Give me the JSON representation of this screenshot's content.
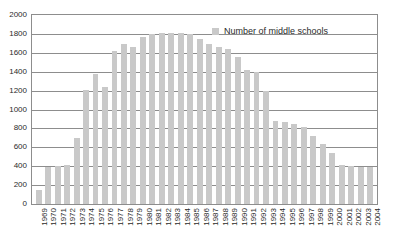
{
  "chart_data": {
    "type": "bar",
    "title": "",
    "xlabel": "",
    "ylabel": "",
    "ylim": [
      0,
      2000
    ],
    "ytick_step": 200,
    "yticks": [
      2000,
      1800,
      1600,
      1400,
      1200,
      1000,
      800,
      600,
      400,
      200,
      0
    ],
    "grid": true,
    "legend_position": "top-right",
    "legend": [
      "Number of middle schools"
    ],
    "bar_color": "#c9c9c9",
    "axis_color": "#8d8d8d",
    "categories": [
      "1969",
      "1970",
      "1971",
      "1972",
      "1973",
      "1974",
      "1975",
      "1976",
      "1977",
      "1978",
      "1979",
      "1980",
      "1981",
      "1982",
      "1983",
      "1984",
      "1985",
      "1986",
      "1987",
      "1988",
      "1989",
      "1990",
      "1991",
      "1992",
      "1993",
      "1994",
      "1995",
      "1996",
      "1997",
      "1998",
      "1999",
      "2000",
      "2001",
      "2002",
      "2003",
      "2004"
    ],
    "series": [
      {
        "name": "Number of middle schools",
        "values": [
          150,
          390,
          400,
          410,
          700,
          1210,
          1380,
          1240,
          1620,
          1690,
          1660,
          1770,
          1800,
          1810,
          1810,
          1810,
          1800,
          1750,
          1690,
          1660,
          1640,
          1560,
          1420,
          1400,
          1200,
          880,
          870,
          850,
          820,
          720,
          640,
          540,
          410,
          400,
          395,
          390
        ]
      }
    ]
  }
}
